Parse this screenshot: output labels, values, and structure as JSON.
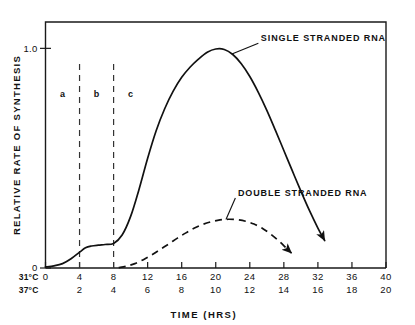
{
  "chart_data": {
    "type": "line",
    "title": "",
    "xlabel": "TIME (HRS)",
    "ylabel": "RELATIVE RATE OF SYNTHESIS",
    "xlim": [
      0,
      40
    ],
    "ylim": [
      0,
      1.12
    ],
    "grid": false,
    "legend_position": "inline-annotations",
    "x_axis_primary_name": "31°C",
    "x_axis_secondary_name": "37°C",
    "xticks_primary": [
      "0",
      "4",
      "8",
      "12",
      "16",
      "20",
      "24",
      "28",
      "32",
      "36",
      "40"
    ],
    "xticks_secondary": [
      "",
      "2",
      "4",
      "6",
      "8",
      "10",
      "12",
      "14",
      "16",
      "18",
      "20"
    ],
    "xtick_values": [
      0,
      4,
      8,
      12,
      16,
      20,
      24,
      28,
      32,
      36,
      40
    ],
    "yticks": [
      "0",
      "1.0"
    ],
    "ytick_values": [
      0,
      1.0
    ],
    "annotations": [
      {
        "text": "a",
        "x": 2.0,
        "y": 0.78
      },
      {
        "text": "b",
        "x": 6.0,
        "y": 0.78
      },
      {
        "text": "c",
        "x": 10.0,
        "y": 0.78
      }
    ],
    "dividers": [
      {
        "x": 4,
        "y_top": 0.93,
        "y_bottom": 0.0,
        "style": "dashed"
      },
      {
        "x": 8,
        "y_top": 0.93,
        "y_bottom": 0.0,
        "style": "dashed"
      }
    ],
    "series": [
      {
        "name": "SINGLE STRANDED RNA",
        "style": "solid",
        "label_x": 25.3,
        "label_y": 1.035,
        "points": [
          [
            0.0,
            0.005
          ],
          [
            1.0,
            0.01
          ],
          [
            2.0,
            0.02
          ],
          [
            3.0,
            0.042
          ],
          [
            4.0,
            0.072
          ],
          [
            4.7,
            0.092
          ],
          [
            5.4,
            0.1
          ],
          [
            6.2,
            0.104
          ],
          [
            7.0,
            0.107
          ],
          [
            8.0,
            0.112
          ],
          [
            9.0,
            0.15
          ],
          [
            10.0,
            0.235
          ],
          [
            11.0,
            0.36
          ],
          [
            12.0,
            0.5
          ],
          [
            13.0,
            0.625
          ],
          [
            14.0,
            0.725
          ],
          [
            15.0,
            0.805
          ],
          [
            16.0,
            0.868
          ],
          [
            17.0,
            0.915
          ],
          [
            18.0,
            0.952
          ],
          [
            19.0,
            0.982
          ],
          [
            20.0,
            0.997
          ],
          [
            21.0,
            0.995
          ],
          [
            22.0,
            0.972
          ],
          [
            23.0,
            0.93
          ],
          [
            24.0,
            0.872
          ],
          [
            25.0,
            0.8
          ],
          [
            26.0,
            0.718
          ],
          [
            27.0,
            0.628
          ],
          [
            28.0,
            0.535
          ],
          [
            29.0,
            0.442
          ],
          [
            30.0,
            0.35
          ],
          [
            31.0,
            0.262
          ],
          [
            32.0,
            0.182
          ],
          [
            32.8,
            0.125
          ]
        ],
        "end_arrow": true
      },
      {
        "name": "DOUBLE STRANDED RNA",
        "style": "dashed",
        "label_x": 22.6,
        "label_y": 0.33,
        "points": [
          [
            8.6,
            0.002
          ],
          [
            9.5,
            0.008
          ],
          [
            10.5,
            0.02
          ],
          [
            11.5,
            0.038
          ],
          [
            12.5,
            0.06
          ],
          [
            13.5,
            0.085
          ],
          [
            14.5,
            0.11
          ],
          [
            15.5,
            0.136
          ],
          [
            16.5,
            0.16
          ],
          [
            17.5,
            0.182
          ],
          [
            18.5,
            0.199
          ],
          [
            19.5,
            0.211
          ],
          [
            20.5,
            0.219
          ],
          [
            21.5,
            0.222
          ],
          [
            22.5,
            0.22
          ],
          [
            23.5,
            0.213
          ],
          [
            24.5,
            0.2
          ],
          [
            25.5,
            0.18
          ],
          [
            26.5,
            0.153
          ],
          [
            27.5,
            0.12
          ],
          [
            28.3,
            0.09
          ],
          [
            28.9,
            0.068
          ]
        ],
        "end_arrow": true
      }
    ]
  },
  "figure": {
    "background_color": "#ffffff",
    "ink_color": "#111111"
  }
}
